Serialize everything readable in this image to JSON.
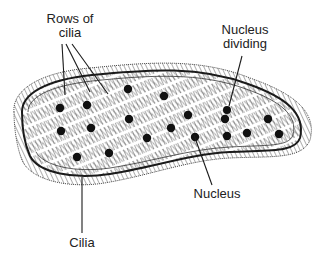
{
  "diagram": {
    "labels": {
      "rows_of_cilia_line1": "Rows of",
      "rows_of_cilia_line2": "cilia",
      "nucleus_dividing_line1": "Nucleus",
      "nucleus_dividing_line2": "dividing",
      "nucleus": "Nucleus",
      "cilia": "Cilia"
    },
    "nuclei": [
      [
        60,
        108
      ],
      [
        87,
        105
      ],
      [
        128,
        89
      ],
      [
        164,
        96
      ],
      [
        61,
        131
      ],
      [
        91,
        128
      ],
      [
        129,
        119
      ],
      [
        188,
        115
      ],
      [
        171,
        128
      ],
      [
        147,
        138
      ],
      [
        77,
        157
      ],
      [
        109,
        153
      ],
      [
        195,
        137
      ],
      [
        247,
        133
      ],
      [
        268,
        119
      ],
      [
        279,
        134
      ],
      [
        227,
        136
      ]
    ],
    "dividing_nucleus": [
      [
        227,
        110
      ],
      [
        225,
        119
      ]
    ],
    "colors": {
      "ink": "#1a1a1a",
      "background": "#ffffff"
    }
  }
}
